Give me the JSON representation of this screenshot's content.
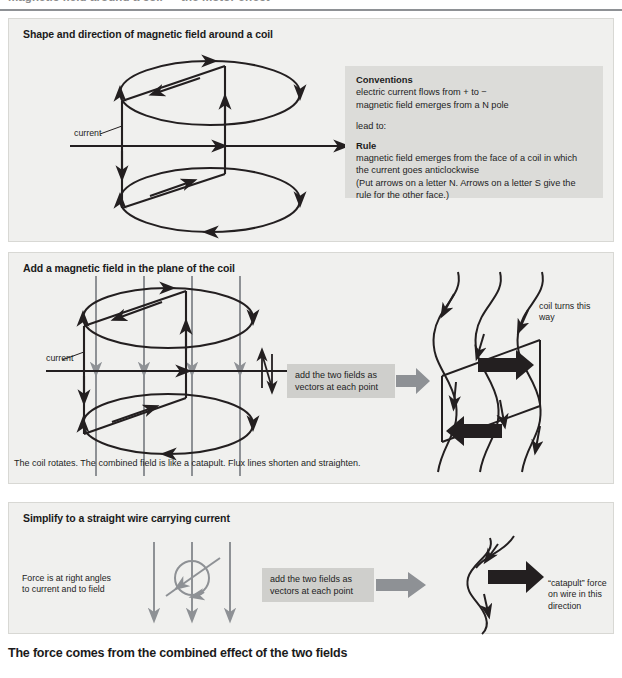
{
  "header": {
    "cut_off_line": "magnetic field around a coil  —  the motor effect",
    "divider": "horizontal-rule"
  },
  "panels": [
    {
      "id": "panel-1",
      "title": "Shape and direction of magnetic field around a coil",
      "current_label": "current",
      "conventions": {
        "heading": "Conventions",
        "line1": "electric current flows from + to −",
        "line2": "magnetic field emerges from a N pole",
        "lead_in": "lead to:",
        "rule_heading": "Rule",
        "rule_line1": "magnetic field emerges from the face of a coil in which",
        "rule_line2": "the current goes anticlockwise",
        "rule_line3": "(Put arrows on a letter N. Arrows on a letter S give the",
        "rule_line4": "rule for the other face.)"
      }
    },
    {
      "id": "panel-2",
      "title": "Add a magnetic field in the plane of the coil",
      "current_label": "current",
      "callout": "add the two fields as\nvectors at each point",
      "result_label": "coil turns this\nway",
      "caption": "The coil rotates. The combined field is like a catapult. Flux lines shorten and straighten."
    },
    {
      "id": "panel-3",
      "title": "Simplify to a straight wire carrying current",
      "force_label": "Force is at right angles\nto current and to field",
      "callout": "add the two fields as\nvectors at each point",
      "result_label": "“catapult” force\non wire in this\ndirection"
    }
  ],
  "footer": {
    "banner": "The force comes from the combined effect of the two fields"
  },
  "colors": {
    "panel_bg": "#f0f0ee",
    "panel_border": "#d8d8d4",
    "conventions_bg": "#dcdcd9",
    "callout_bg": "#cfcfcc",
    "ink": "#231f20",
    "field_gray": "#8e9195",
    "arrow_gray": "#8e9195",
    "page_bg": "#ffffff"
  },
  "icons": {
    "flow_arrow": "right-arrow-icon",
    "force_arrow": "force-arrow-icon",
    "field_line": "field-line-icon",
    "current_arrow": "current-arrow-icon"
  }
}
